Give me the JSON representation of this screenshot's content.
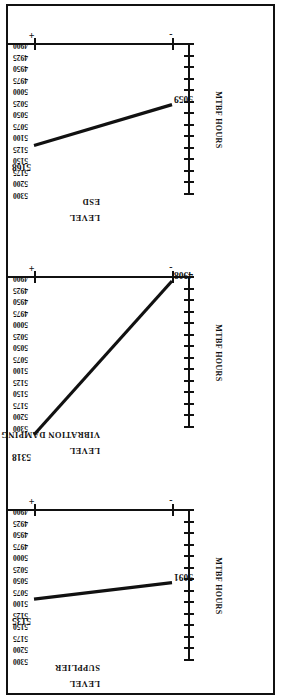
{
  "figure": {
    "title": "",
    "value_axis_title": "MTBF HOURS",
    "level_axis_title": "LEVEL",
    "level_minus": "-",
    "level_plus": "+"
  },
  "axis": {
    "tick_labels": [
      "5300",
      "5200",
      "5175",
      "5150",
      "5125",
      "5100",
      "5075",
      "5050",
      "5025",
      "5000",
      "4975",
      "4950",
      "4925",
      "4900"
    ],
    "min": 4900,
    "max": 5300
  },
  "panels": [
    {
      "factor": "ESD",
      "minus_value": "5059",
      "plus_value": "5168"
    },
    {
      "factor": "VIBRATION DAMPING",
      "minus_value": "4908",
      "plus_value": "5318"
    },
    {
      "factor": "SUPPLIER",
      "minus_value": "5091",
      "plus_value": "5135"
    }
  ],
  "chart_data": {
    "type": "line",
    "title": "",
    "xlabel": "LEVEL",
    "ylabel": "MTBF HOURS",
    "ylim": [
      4900,
      5300
    ],
    "grid": false,
    "legend": "none",
    "orientation": "rotated-90-ccw",
    "categories": [
      "-",
      "+"
    ],
    "tick_labels": [
      "5300",
      "5200",
      "5175",
      "5150",
      "5125",
      "5100",
      "5075",
      "5050",
      "5025",
      "5000",
      "4975",
      "4950",
      "4925",
      "4900"
    ],
    "panels": [
      {
        "name": "ESD",
        "values": [
          5059,
          5168
        ],
        "effect": 109
      },
      {
        "name": "VIBRATION DAMPING",
        "values": [
          4908,
          5318
        ],
        "effect": 410
      },
      {
        "name": "SUPPLIER",
        "values": [
          5091,
          5135
        ],
        "effect": 44
      }
    ]
  }
}
